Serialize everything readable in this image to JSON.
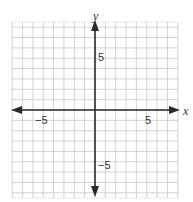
{
  "figure": {
    "type": "coordinate_plane",
    "x_axis_label": "x",
    "y_axis_label": "y",
    "x_ticks": [
      {
        "value": -5,
        "label": "−5"
      },
      {
        "value": 5,
        "label": "5"
      }
    ],
    "y_ticks": [
      {
        "value": 5,
        "label": "5"
      },
      {
        "value": -5,
        "label": "−5"
      }
    ],
    "grid": {
      "x_range": [
        -8,
        8
      ],
      "y_range": [
        -8.5,
        8.5
      ],
      "step": 1,
      "shown": true
    },
    "colors": {
      "grid": "#c8c8c8",
      "axis": "#2a2a2a",
      "text": "#333333",
      "background": "#ffffff"
    }
  }
}
